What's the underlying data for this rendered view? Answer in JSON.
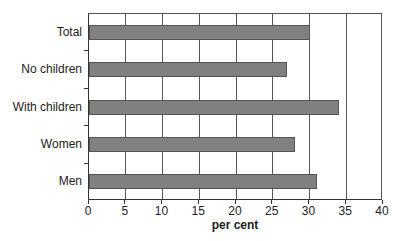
{
  "chart_data": {
    "type": "bar",
    "orientation": "horizontal",
    "title": "",
    "categories": [
      "Total",
      "No children",
      "With children",
      "Women",
      "Men"
    ],
    "values": [
      30,
      27,
      34,
      28,
      31
    ],
    "xlabel": "per cent",
    "ylabel": "",
    "xlim": [
      0,
      40
    ],
    "xticks": [
      "0",
      "5",
      "10",
      "15",
      "20",
      "25",
      "30",
      "35",
      "40"
    ],
    "grid": "vertical",
    "legend": null,
    "bar_color": "#808080"
  }
}
